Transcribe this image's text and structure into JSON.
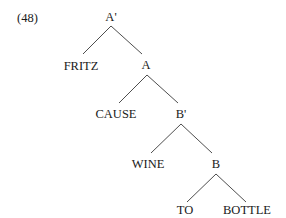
{
  "example_number": "(48)",
  "tree": {
    "nodes": {
      "root": "A'",
      "fritz": "FRITZ",
      "a": "A",
      "cause": "CAUSE",
      "b_prime": "B'",
      "wine": "WINE",
      "b": "B",
      "to": "TO",
      "bottle": "BOTTLE"
    },
    "edges": [
      [
        "A'",
        "FRITZ"
      ],
      [
        "A'",
        "A"
      ],
      [
        "A",
        "CAUSE"
      ],
      [
        "A",
        "B'"
      ],
      [
        "B'",
        "WINE"
      ],
      [
        "B'",
        "B"
      ],
      [
        "B",
        "TO"
      ],
      [
        "B",
        "BOTTLE"
      ]
    ]
  }
}
